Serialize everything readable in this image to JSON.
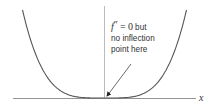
{
  "diagram": {
    "function": "x^4",
    "x_domain": [
      -1,
      1
    ],
    "axis_label_x": "x",
    "annotation": {
      "func_symbol": "f",
      "prime": "″",
      "equals": "= 0",
      "line1_suffix": "but",
      "line2": "no inflection",
      "line3": "point here"
    },
    "colors": {
      "curve": "#555555",
      "axis": "#888888",
      "arrow": "#444444",
      "text": "#333333"
    }
  }
}
